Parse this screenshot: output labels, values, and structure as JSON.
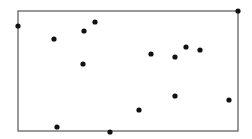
{
  "chart_data": {
    "type": "scatter",
    "title": "",
    "xlabel": "",
    "ylabel": "",
    "grid": false,
    "legend": null,
    "frame": {
      "left": 18,
      "top": 11,
      "right": 238,
      "bottom": 131,
      "color": "#555555"
    },
    "point_color": "#111111",
    "point_radius": 2.6,
    "points_px": [
      {
        "x": 18,
        "y": 26
      },
      {
        "x": 238,
        "y": 11
      },
      {
        "x": 95,
        "y": 22
      },
      {
        "x": 84,
        "y": 31
      },
      {
        "x": 54,
        "y": 39
      },
      {
        "x": 186,
        "y": 47
      },
      {
        "x": 200,
        "y": 50
      },
      {
        "x": 151,
        "y": 54
      },
      {
        "x": 175,
        "y": 57
      },
      {
        "x": 83,
        "y": 64
      },
      {
        "x": 175,
        "y": 96
      },
      {
        "x": 229,
        "y": 100
      },
      {
        "x": 139,
        "y": 110
      },
      {
        "x": 57,
        "y": 127
      },
      {
        "x": 110,
        "y": 132
      }
    ]
  }
}
